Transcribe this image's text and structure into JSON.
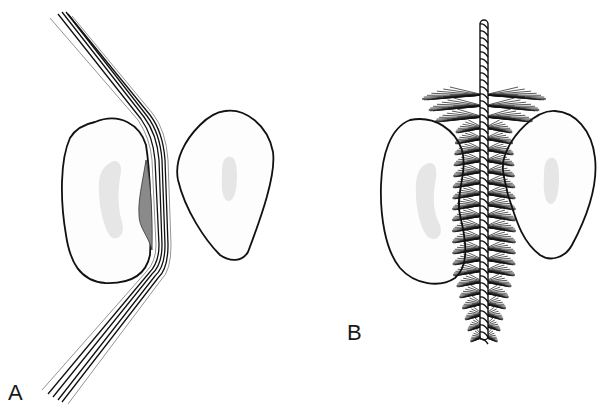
{
  "figure": {
    "panels": [
      {
        "id": "A",
        "label": "A",
        "description": "Dental floss wrapped around tooth surface in interproximal space",
        "elements": [
          "tooth-left",
          "tooth-right",
          "dental-floss",
          "plaque-deposit"
        ]
      },
      {
        "id": "B",
        "label": "B",
        "description": "Interdental brush inserted between two teeth",
        "elements": [
          "tooth-left",
          "tooth-right",
          "interdental-brush"
        ]
      }
    ],
    "colors": {
      "outline": "#111111",
      "pulp": "#e6e6e6",
      "plaque": "#8a8a8a",
      "background": "#ffffff"
    }
  }
}
